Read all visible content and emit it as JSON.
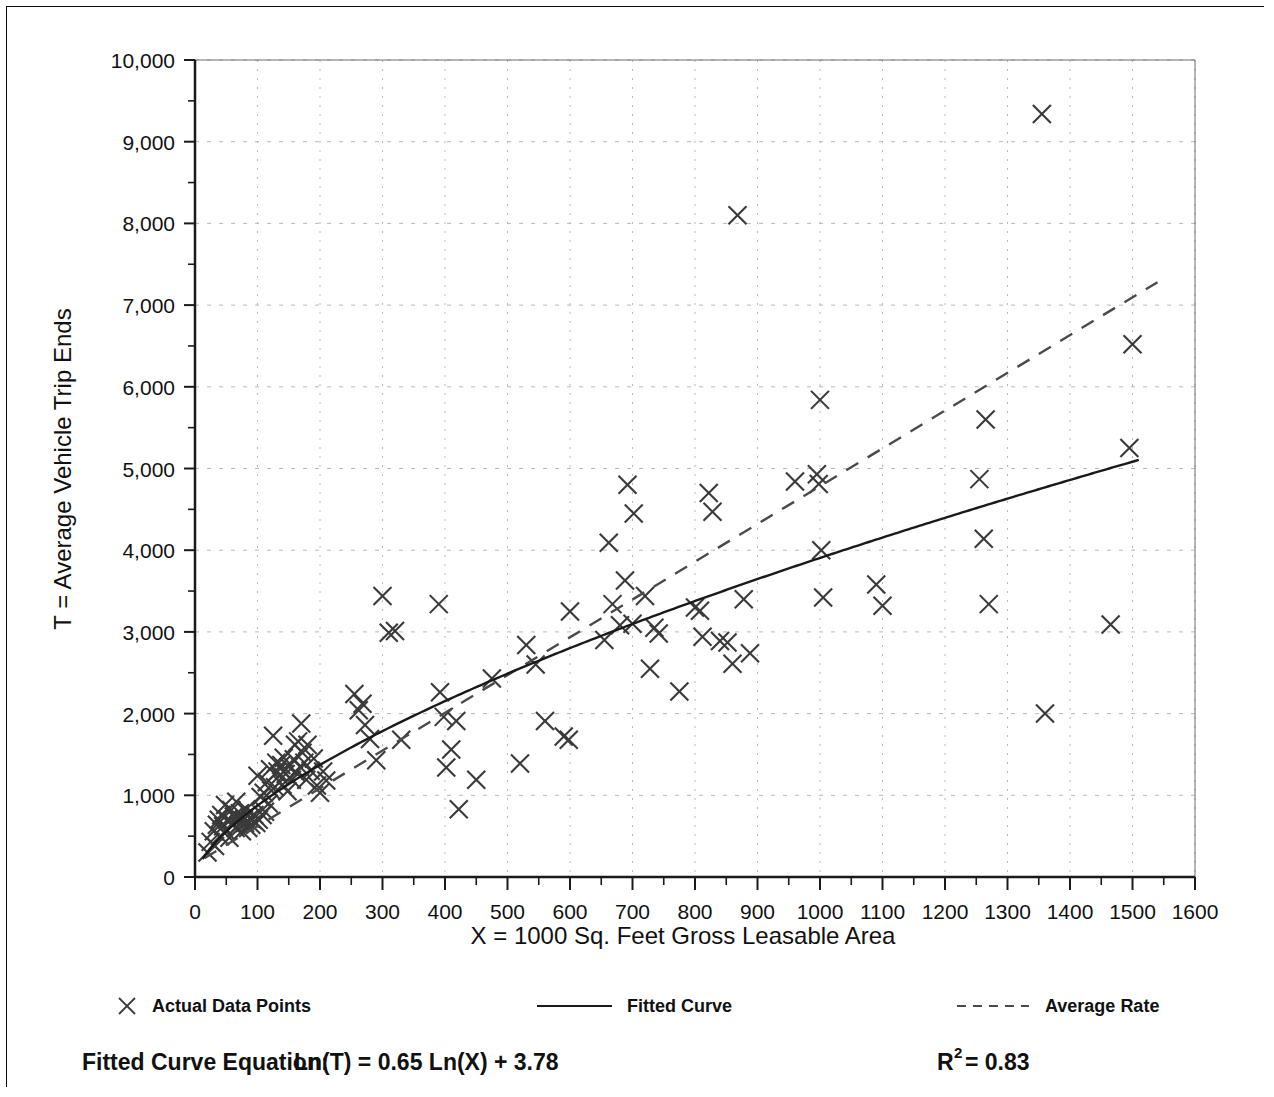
{
  "chart_data": {
    "type": "scatter",
    "title": "",
    "xlabel": "X = 1000 Sq. Feet Gross Leasable Area",
    "ylabel": "T = Average Vehicle Trip Ends",
    "xlim": [
      0,
      1600
    ],
    "ylim": [
      0,
      10000
    ],
    "xticks": [
      0,
      100,
      200,
      300,
      400,
      500,
      600,
      700,
      800,
      900,
      1000,
      1100,
      1200,
      1300,
      1400,
      1500,
      1600
    ],
    "xtick_labels": [
      "0",
      "100",
      "200",
      "300",
      "400",
      "500",
      "600",
      "700",
      "800",
      "900",
      "1000",
      "1100",
      "1200",
      "1300",
      "1400",
      "1500",
      "1600"
    ],
    "yticks": [
      0,
      1000,
      2000,
      3000,
      4000,
      5000,
      6000,
      7000,
      8000,
      9000,
      10000
    ],
    "ytick_labels": [
      "0",
      "1,000",
      "2,000",
      "3,000",
      "4,000",
      "5,000",
      "6,000",
      "7,000",
      "8,000",
      "9,000",
      "10,000"
    ],
    "y_minor_tick_step": 500,
    "x_minor_tick_step": 50,
    "grid": true,
    "grid_style": "dotted",
    "grid_color": "#b8b8b8",
    "marker": "x-cross",
    "marker_color": "#3a3a3a",
    "legend_position": "below-axes",
    "series": [
      {
        "name": "Actual Data Points",
        "type": "scatter",
        "marker": "x-cross",
        "points": [
          [
            20,
            300
          ],
          [
            25,
            430
          ],
          [
            30,
            560
          ],
          [
            32,
            380
          ],
          [
            35,
            640
          ],
          [
            38,
            700
          ],
          [
            40,
            500
          ],
          [
            42,
            760
          ],
          [
            45,
            620
          ],
          [
            48,
            880
          ],
          [
            50,
            560
          ],
          [
            52,
            700
          ],
          [
            55,
            480
          ],
          [
            58,
            820
          ],
          [
            60,
            660
          ],
          [
            62,
            740
          ],
          [
            65,
            600
          ],
          [
            66,
            920
          ],
          [
            68,
            700
          ],
          [
            70,
            640
          ],
          [
            72,
            780
          ],
          [
            75,
            560
          ],
          [
            78,
            700
          ],
          [
            80,
            660
          ],
          [
            82,
            830
          ],
          [
            85,
            600
          ],
          [
            88,
            720
          ],
          [
            90,
            640
          ],
          [
            92,
            700
          ],
          [
            95,
            760
          ],
          [
            98,
            660
          ],
          [
            100,
            1240
          ],
          [
            102,
            700
          ],
          [
            105,
            980
          ],
          [
            108,
            760
          ],
          [
            110,
            1030
          ],
          [
            112,
            800
          ],
          [
            115,
            1160
          ],
          [
            118,
            900
          ],
          [
            120,
            1320
          ],
          [
            122,
            1060
          ],
          [
            125,
            1730
          ],
          [
            128,
            1100
          ],
          [
            130,
            1400
          ],
          [
            132,
            1290
          ],
          [
            135,
            1240
          ],
          [
            138,
            1370
          ],
          [
            140,
            1130
          ],
          [
            142,
            1460
          ],
          [
            145,
            1260
          ],
          [
            148,
            1050
          ],
          [
            150,
            1350
          ],
          [
            155,
            1190
          ],
          [
            158,
            1440
          ],
          [
            160,
            1620
          ],
          [
            162,
            1280
          ],
          [
            165,
            1660
          ],
          [
            168,
            1350
          ],
          [
            170,
            1880
          ],
          [
            172,
            1520
          ],
          [
            175,
            1400
          ],
          [
            178,
            1190
          ],
          [
            180,
            1620
          ],
          [
            185,
            1300
          ],
          [
            190,
            1450
          ],
          [
            195,
            1120
          ],
          [
            200,
            1030
          ],
          [
            205,
            1290
          ],
          [
            210,
            1180
          ],
          [
            255,
            2240
          ],
          [
            262,
            2040
          ],
          [
            268,
            2120
          ],
          [
            272,
            1860
          ],
          [
            280,
            1690
          ],
          [
            290,
            1430
          ],
          [
            300,
            3440
          ],
          [
            310,
            2990
          ],
          [
            320,
            3010
          ],
          [
            330,
            1680
          ],
          [
            390,
            3340
          ],
          [
            392,
            2260
          ],
          [
            398,
            1960
          ],
          [
            402,
            1340
          ],
          [
            410,
            1560
          ],
          [
            418,
            1910
          ],
          [
            422,
            830
          ],
          [
            450,
            1190
          ],
          [
            475,
            2430
          ],
          [
            520,
            1390
          ],
          [
            530,
            2840
          ],
          [
            545,
            2600
          ],
          [
            560,
            1910
          ],
          [
            590,
            1720
          ],
          [
            598,
            1680
          ],
          [
            600,
            3250
          ],
          [
            655,
            2900
          ],
          [
            662,
            4090
          ],
          [
            668,
            3340
          ],
          [
            680,
            3080
          ],
          [
            688,
            3630
          ],
          [
            692,
            4800
          ],
          [
            700,
            3100
          ],
          [
            702,
            4450
          ],
          [
            720,
            3440
          ],
          [
            728,
            2550
          ],
          [
            735,
            3050
          ],
          [
            742,
            2980
          ],
          [
            775,
            2270
          ],
          [
            800,
            3300
          ],
          [
            808,
            3260
          ],
          [
            812,
            2940
          ],
          [
            822,
            4700
          ],
          [
            828,
            4470
          ],
          [
            840,
            2890
          ],
          [
            852,
            2870
          ],
          [
            860,
            2610
          ],
          [
            868,
            8100
          ],
          [
            878,
            3400
          ],
          [
            888,
            2740
          ],
          [
            960,
            4840
          ],
          [
            995,
            4930
          ],
          [
            998,
            4810
          ],
          [
            1000,
            5840
          ],
          [
            1002,
            4000
          ],
          [
            1005,
            3420
          ],
          [
            1090,
            3580
          ],
          [
            1100,
            3320
          ],
          [
            1255,
            4870
          ],
          [
            1262,
            4140
          ],
          [
            1265,
            5600
          ],
          [
            1270,
            3340
          ],
          [
            1355,
            9340
          ],
          [
            1360,
            2000
          ],
          [
            1465,
            3090
          ],
          [
            1495,
            5250
          ],
          [
            1500,
            6520
          ]
        ]
      },
      {
        "name": "Fitted Curve",
        "type": "line",
        "style": "solid",
        "equation": "Ln(T) = 0.65 Ln(X) + 3.78",
        "slope": 0.65,
        "intercept": 3.78
      },
      {
        "name": "Average Rate",
        "type": "line",
        "style": "dashed",
        "endpoints": [
          [
            15,
            230
          ],
          [
            1540,
            7280
          ]
        ]
      }
    ],
    "annotations": {
      "equation_label": "Fitted Curve Equation:",
      "equation_text": "Ln(T) = 0.65 Ln(X) + 3.78",
      "r_squared_symbol": "R",
      "r_squared_exponent": "2",
      "r_squared_value": "= 0.83"
    }
  },
  "legend": {
    "entries": [
      {
        "label": "Actual Data Points",
        "icon": "x-marker-icon"
      },
      {
        "label": "Fitted Curve",
        "icon": "solid-line-icon"
      },
      {
        "label": "Average Rate",
        "icon": "dashed-line-icon"
      }
    ]
  },
  "colors": {
    "frame": "#0a0a0a",
    "axis": "#1a1a1a",
    "grid": "#b8b8b8",
    "marker": "#3a3a3a",
    "fitted_curve": "#1a1a1a",
    "average_rate": "#4a4a4a",
    "background": "#ffffff"
  }
}
